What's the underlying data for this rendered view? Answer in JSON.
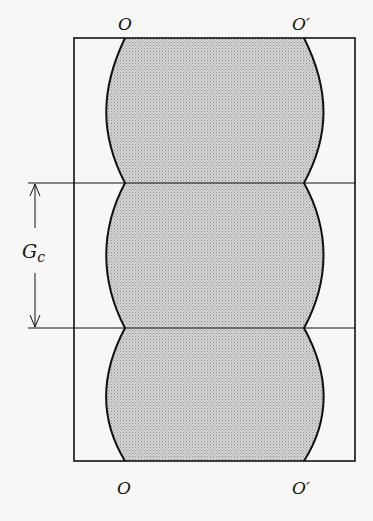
{
  "figure": {
    "labels": {
      "top_left": "O",
      "top_right": "O′",
      "bottom_left": "O",
      "bottom_right": "O′",
      "dimension": "G",
      "dimension_subscript": "c"
    },
    "colors": {
      "line": "#111111",
      "fill": "#c9c9c9",
      "background": "#f7f7f5"
    },
    "geometry": {
      "outer_box": {
        "x": 74,
        "y": 38,
        "width": 281,
        "height": 423
      },
      "divider_y": [
        183,
        328
      ],
      "curve_pinch_x": {
        "left": 125,
        "right": 304
      },
      "curve_bulge_x": {
        "left": 108,
        "right": 321
      }
    }
  }
}
